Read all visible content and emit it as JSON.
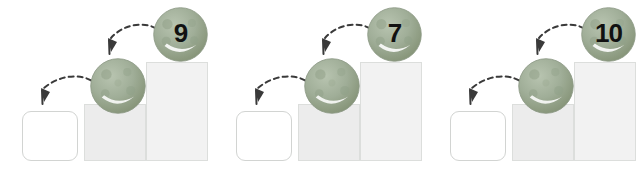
{
  "page": {
    "background_color": "#ffffff",
    "width": 642,
    "height": 181
  },
  "style": {
    "ball_base_color": "#9aa893",
    "ball_spot_color": "#8a9a83",
    "ball_highlight_color": "#ffffff",
    "box_empty_fill": "#ffffff",
    "box_empty_border": "#d2d4d2",
    "box_mid_fill": "#ececec",
    "box_tall_fill": "#f2f2f2",
    "box_border": "#dcdedc",
    "arrow_color": "#3a3a3a",
    "number_color": "#111111"
  },
  "groups": [
    {
      "id": "group-1",
      "number_label": "9",
      "boxes": [
        {
          "name": "empty-box",
          "fill": "white",
          "label": ""
        },
        {
          "name": "medium-box",
          "fill": "light-gray",
          "label": ""
        },
        {
          "name": "tall-box",
          "fill": "very-light-gray",
          "label": ""
        }
      ],
      "balls": [
        {
          "name": "plain-ball",
          "label": ""
        },
        {
          "name": "numbered-ball",
          "label": "9"
        }
      ],
      "arrows": [
        {
          "name": "arrow-to-empty-box"
        },
        {
          "name": "arrow-to-plain-ball"
        }
      ]
    },
    {
      "id": "group-2",
      "number_label": "7",
      "boxes": [
        {
          "name": "empty-box",
          "fill": "white",
          "label": ""
        },
        {
          "name": "medium-box",
          "fill": "light-gray",
          "label": ""
        },
        {
          "name": "tall-box",
          "fill": "very-light-gray",
          "label": ""
        }
      ],
      "balls": [
        {
          "name": "plain-ball",
          "label": ""
        },
        {
          "name": "numbered-ball",
          "label": "7"
        }
      ],
      "arrows": [
        {
          "name": "arrow-to-empty-box"
        },
        {
          "name": "arrow-to-plain-ball"
        }
      ]
    },
    {
      "id": "group-3",
      "number_label": "10",
      "boxes": [
        {
          "name": "empty-box",
          "fill": "white",
          "label": ""
        },
        {
          "name": "medium-box",
          "fill": "light-gray",
          "label": ""
        },
        {
          "name": "tall-box",
          "fill": "very-light-gray",
          "label": ""
        }
      ],
      "balls": [
        {
          "name": "plain-ball",
          "label": ""
        },
        {
          "name": "numbered-ball",
          "label": "10"
        }
      ],
      "arrows": [
        {
          "name": "arrow-to-empty-box"
        },
        {
          "name": "arrow-to-plain-ball"
        }
      ]
    }
  ]
}
